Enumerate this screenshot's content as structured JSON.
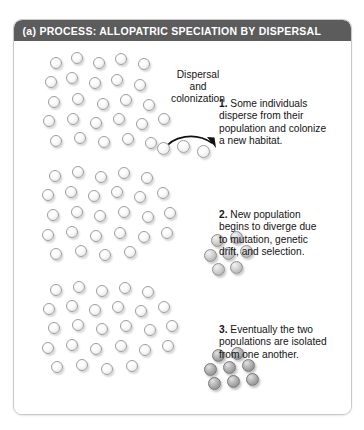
{
  "figure": {
    "panel_label": "(a)",
    "header": "(a) PROCESS: ALLOPATRIC SPECIATION BY DISPERSAL",
    "header_bg": "#5c5c5c",
    "header_text_color": "#ffffff",
    "card_bg": "#ffffff",
    "card_border": "#c9c9c9"
  },
  "annotations": {
    "dispersal_label_line1": "Dispersal",
    "dispersal_label_line2": "and",
    "dispersal_label_line3": "colonization",
    "arrow_icon": "curved-dispersal-arrow"
  },
  "steps": [
    {
      "number": "1.",
      "text": " Some individuals disperse from their population and colonize a new habitat."
    },
    {
      "number": "2.",
      "text": " New population begins to diverge due to mutation, genetic drift, and selection."
    },
    {
      "number": "3.",
      "text": " Eventually the two populations are isolated from one another."
    }
  ],
  "populations": [
    {
      "name": "source-population-row-1",
      "shade": "pale",
      "count": 26,
      "description": "Large ancestral population of pale individuals"
    },
    {
      "name": "dispersing-individuals",
      "shade": "pale",
      "count": 3,
      "description": "Three individuals migrating along the dispersal arrow"
    },
    {
      "name": "source-population-row-2",
      "shade": "pale",
      "count": 26,
      "description": "Ancestral population unchanged"
    },
    {
      "name": "founder-population-row-2",
      "shade": "mid",
      "count": 7,
      "description": "New population beginning to diverge, intermediate shade"
    },
    {
      "name": "source-population-row-3",
      "shade": "pale",
      "count": 26,
      "description": "Ancestral population unchanged"
    },
    {
      "name": "founder-population-row-3",
      "shade": "dark",
      "count": 8,
      "description": "Isolated, fully diverged population, dark shade"
    }
  ],
  "colors": {
    "pale_sphere": "#f2f2f2",
    "mid_sphere": "#c0c0c0",
    "dark_sphere": "#9b9b9b",
    "text": "#141414"
  }
}
